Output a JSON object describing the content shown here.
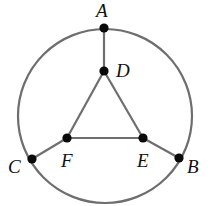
{
  "diagram": {
    "type": "graph",
    "circle": {
      "cx": 105,
      "cy": 116,
      "r": 87,
      "color": "#6e6e6e"
    },
    "nodes": [
      {
        "id": "A",
        "label": "A",
        "x": 104,
        "y": 28,
        "lx": 96,
        "ly": 17
      },
      {
        "id": "D",
        "label": "D",
        "x": 104,
        "y": 71,
        "lx": 116,
        "ly": 77
      },
      {
        "id": "F",
        "label": "F",
        "x": 67,
        "y": 138,
        "lx": 61,
        "ly": 166
      },
      {
        "id": "E",
        "label": "E",
        "x": 143,
        "y": 138,
        "lx": 137,
        "ly": 166
      },
      {
        "id": "C",
        "label": "C",
        "x": 32,
        "y": 159,
        "lx": 8,
        "ly": 172
      },
      {
        "id": "B",
        "label": "B",
        "x": 179,
        "y": 158,
        "lx": 187,
        "ly": 172
      }
    ],
    "edges": [
      [
        "A",
        "D"
      ],
      [
        "D",
        "F"
      ],
      [
        "D",
        "E"
      ],
      [
        "F",
        "E"
      ],
      [
        "C",
        "F"
      ],
      [
        "E",
        "B"
      ]
    ],
    "arcs": [
      {
        "from": "A",
        "to": "B"
      },
      {
        "from": "B",
        "to": "C"
      },
      {
        "from": "C",
        "to": "A"
      }
    ],
    "labels": {
      "A": "A",
      "B": "B",
      "C": "C",
      "D": "D",
      "E": "E",
      "F": "F"
    }
  }
}
